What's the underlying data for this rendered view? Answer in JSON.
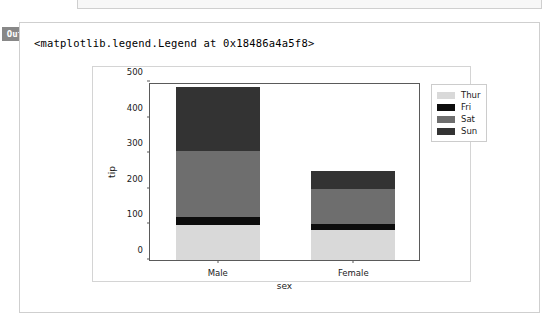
{
  "notebook": {
    "prompt_label": "Out",
    "output_repr": "<matplotlib.legend.Legend at 0x18486a4a5f8>"
  },
  "colors": {
    "thur": "#d9d9d9",
    "fri": "#0d0d0d",
    "sat": "#6e6e6e",
    "sun": "#333333",
    "axis": "#5a5a5a",
    "figure_border": "#d4d4d4",
    "cell_border": "#cfcfcf",
    "prompt_bg": "#888888"
  },
  "chart_data": {
    "type": "bar",
    "barmode": "stacked",
    "title": "",
    "xlabel": "sex",
    "ylabel": "tip",
    "categories": [
      "Male",
      "Female"
    ],
    "ylim": [
      0,
      500
    ],
    "yticks": [
      0,
      100,
      200,
      300,
      400,
      500
    ],
    "ytick_labels": [
      "0",
      "100",
      "200",
      "300",
      "400",
      "500"
    ],
    "grid": false,
    "legend_position": "upper right outside",
    "series": [
      {
        "name": "Thur",
        "color": "#d9d9d9",
        "values": [
          99,
          85
        ]
      },
      {
        "name": "Fri",
        "color": "#0d0d0d",
        "values": [
          23,
          15
        ]
      },
      {
        "name": "Sat",
        "color": "#6e6e6e",
        "values": [
          185,
          100
        ]
      },
      {
        "name": "Sun",
        "color": "#333333",
        "values": [
          179,
          50
        ]
      }
    ],
    "totals": [
      486,
      250
    ]
  }
}
